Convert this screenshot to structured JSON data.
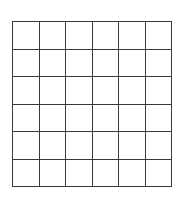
{
  "figure": {
    "name": "blank-grid",
    "shape": "rectangular-lattice",
    "rows": 6,
    "columns": 6,
    "total_cells": 36,
    "cell_label": "",
    "cells": [
      "",
      "",
      "",
      "",
      "",
      "",
      "",
      "",
      "",
      "",
      "",
      "",
      "",
      "",
      "",
      "",
      "",
      "",
      "",
      "",
      "",
      "",
      "",
      "",
      "",
      "",
      "",
      "",
      "",
      "",
      "",
      "",
      "",
      "",
      "",
      ""
    ],
    "colors": {
      "background": "#ffffff",
      "line": "#3a3a3a",
      "cell_fill": "#ffffff"
    },
    "geometry": {
      "left_px": 12,
      "top_px": 21,
      "width_px": 160,
      "height_px": 166,
      "cell_width_px": 26.7,
      "cell_height_px": 27.7,
      "line_width_px": 1.5
    }
  }
}
